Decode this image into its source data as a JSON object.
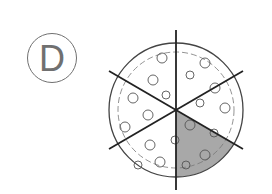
{
  "option": {
    "letter": "D"
  },
  "figure": {
    "type": "pizza-fraction",
    "slices_total": 6,
    "slices_shaded": 1,
    "shaded_color": "#a8a8a8",
    "outline_color": "#333333"
  }
}
